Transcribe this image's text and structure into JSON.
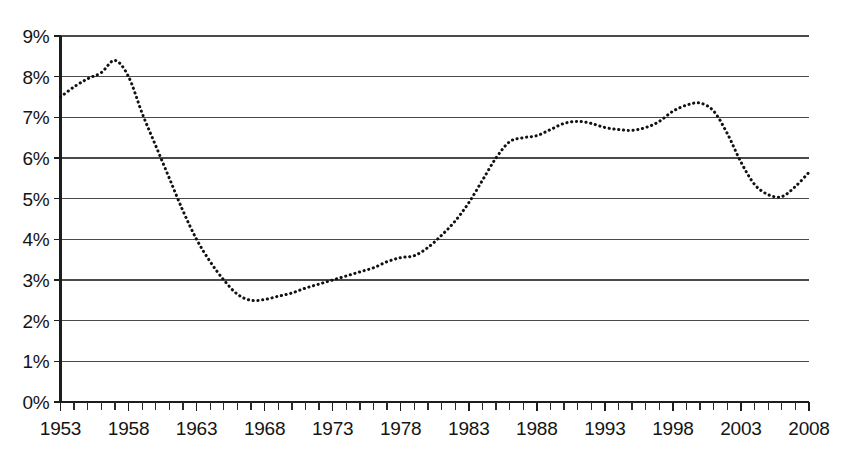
{
  "chart_data": {
    "type": "line",
    "title": "",
    "subtitle": "",
    "xlabel": "",
    "ylabel": "",
    "style": "dotted",
    "grid": "horizontal",
    "legend": "none",
    "xlim": [
      1953,
      2008
    ],
    "ylim": [
      0,
      9
    ],
    "y_tick_labels": [
      "0%",
      "1%",
      "2%",
      "3%",
      "4%",
      "5%",
      "6%",
      "7%",
      "8%",
      "9%"
    ],
    "y_tick_values": [
      0,
      1,
      2,
      3,
      4,
      5,
      6,
      7,
      8,
      9
    ],
    "x_tick_labels": [
      "1953",
      "1958",
      "1963",
      "1968",
      "1973",
      "1978",
      "1983",
      "1988",
      "1993",
      "1998",
      "2003",
      "2008"
    ],
    "x_tick_values": [
      1953,
      1958,
      1963,
      1968,
      1973,
      1978,
      1983,
      1988,
      1993,
      1998,
      2003,
      2008
    ],
    "x_minor_tick_step": 1,
    "units": "percent",
    "series_name": "value",
    "x": [
      1953,
      1954,
      1955,
      1956,
      1957,
      1958,
      1959,
      1960,
      1961,
      1962,
      1963,
      1964,
      1965,
      1966,
      1967,
      1968,
      1969,
      1970,
      1971,
      1972,
      1973,
      1974,
      1975,
      1976,
      1977,
      1978,
      1979,
      1980,
      1981,
      1982,
      1983,
      1984,
      1985,
      1986,
      1987,
      1988,
      1989,
      1990,
      1991,
      1992,
      1993,
      1994,
      1995,
      1996,
      1997,
      1998,
      1999,
      2000,
      2001,
      2002,
      2003,
      2004,
      2005,
      2006,
      2007,
      2008
    ],
    "values": [
      7.5,
      7.75,
      7.95,
      8.1,
      8.4,
      8.0,
      7.1,
      6.3,
      5.5,
      4.7,
      4.0,
      3.45,
      3.0,
      2.65,
      2.5,
      2.52,
      2.6,
      2.68,
      2.8,
      2.9,
      3.0,
      3.1,
      3.2,
      3.3,
      3.45,
      3.55,
      3.6,
      3.8,
      4.1,
      4.45,
      4.9,
      5.45,
      6.0,
      6.4,
      6.5,
      6.55,
      6.7,
      6.85,
      6.9,
      6.85,
      6.75,
      6.7,
      6.68,
      6.75,
      6.9,
      7.15,
      7.3,
      7.35,
      7.15,
      6.6,
      5.9,
      5.35,
      5.1,
      5.05,
      5.3,
      5.65
    ],
    "annotations": {
      "peak_early": {
        "year": 1957,
        "value": 8.4
      },
      "trough_mid": {
        "year": 1967,
        "value": 2.5
      },
      "peak_late": {
        "year": 2000,
        "value": 7.35
      },
      "trough_late": {
        "year": 2006,
        "value": 5.05
      },
      "end": {
        "year": 2008,
        "value": 5.65
      }
    }
  },
  "colors": {
    "series": "#111111",
    "gridline": "#4a4a4a",
    "axis": "#1d1d1d",
    "background": "#ffffff",
    "text": "#141414"
  }
}
